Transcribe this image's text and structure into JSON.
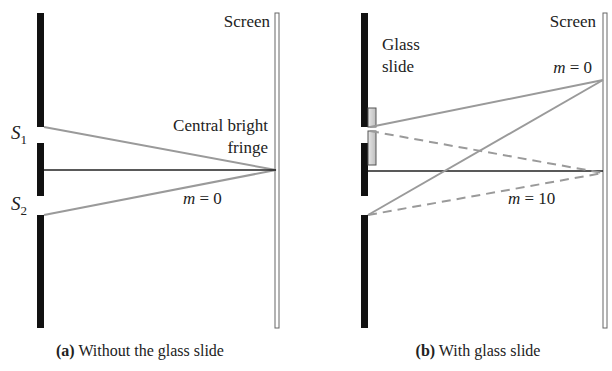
{
  "figure": {
    "panels": [
      {
        "id": "a",
        "screen_label": "Screen",
        "slit_labels": {
          "s1": "S",
          "s1_sub": "1",
          "s2": "S",
          "s2_sub": "2"
        },
        "annotation_line1": "Central bright",
        "annotation_line2": "fringe",
        "order_label_var": "m",
        "order_label_rest": " = 0",
        "caption_prefix": "(a)",
        "caption_text": " Without the glass slide"
      },
      {
        "id": "b",
        "screen_label": "Screen",
        "glass_label_line1": "Glass",
        "glass_label_line2": "slide",
        "top_order_var": "m",
        "top_order_rest": " = 0",
        "center_order_var": "m",
        "center_order_rest": " = 10",
        "caption_prefix": "(b)",
        "caption_text": " With glass slide"
      }
    ],
    "colors": {
      "barrier": "#111111",
      "ray": "#9a9a9a",
      "axis": "#222222",
      "screen": "#777777",
      "glass_fill": "#d4d4d4",
      "glass_stroke": "#555555",
      "text": "#222222"
    }
  }
}
